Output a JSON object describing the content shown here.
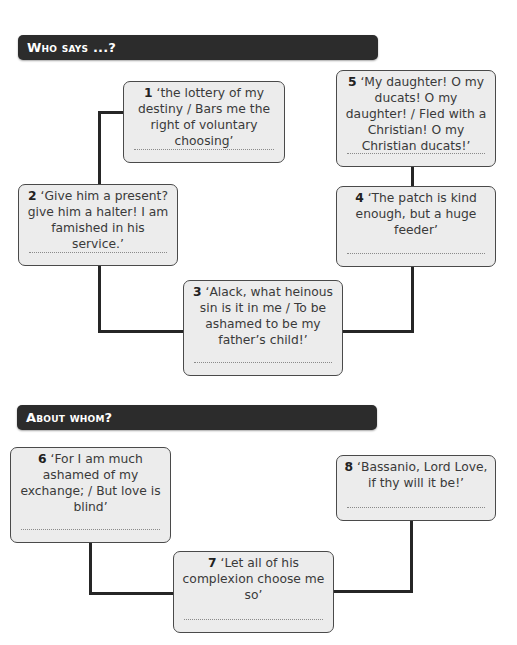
{
  "sections": [
    {
      "title": "Who says ...?",
      "quotes": [
        {
          "number": "1",
          "text": "‘the lottery of my destiny / Bars me the right of voluntary choosing’",
          "answer": ""
        },
        {
          "number": "2",
          "text": "‘Give him a present? give him a halter! I am famished in his service.’",
          "answer": ""
        },
        {
          "number": "3",
          "text": "‘Alack, what heinous sin is it in me / To be ashamed to be my father’s child!’",
          "answer": ""
        },
        {
          "number": "4",
          "text": "‘The patch is kind enough, but a huge feeder’",
          "answer": ""
        },
        {
          "number": "5",
          "text": "‘My daughter! O my ducats! O my daughter! / Fled with a Christian! O my Christian ducats!’",
          "answer": ""
        }
      ]
    },
    {
      "title": "About whom?",
      "quotes": [
        {
          "number": "6",
          "text": "‘For I am much ashamed of my exchange; / But love is blind’",
          "answer": ""
        },
        {
          "number": "7",
          "text": "‘Let all of his complexion choose me so’",
          "answer": ""
        },
        {
          "number": "8",
          "text": "‘Bassanio, Lord Love, if thy will it be!’",
          "answer": ""
        }
      ]
    }
  ],
  "colors": {
    "header_bg": "#2c2c2c",
    "header_text": "#ffffff",
    "box_bg": "#ececec",
    "box_border": "#4a4a4a",
    "connector": "#262626"
  }
}
